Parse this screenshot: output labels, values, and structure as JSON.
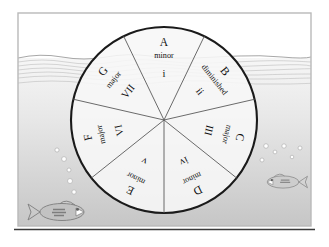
{
  "scene": {
    "title": "Diatonic wheel underwater scene",
    "frame_color": "#b9b9b9",
    "baseline_color": "#3a3a3a",
    "sky_color": "#ffffff",
    "water_top_color": "#f3f3f3",
    "water_bottom_color": "#c9c9c9",
    "wave_color": "#9a9a9a",
    "bubble_color": "#ffffff",
    "bubble_stroke": "#b0b0b0",
    "fish_color": "#9b9b9b"
  },
  "wheel": {
    "center_x": 164,
    "center_y": 120,
    "radius": 93,
    "outline_color": "#1a1a1a",
    "spoke_color": "#555555",
    "fill_color": "#f7f7f7",
    "sector_count": 7,
    "sectors": [
      {
        "id": "a-minor",
        "root": "A",
        "quality": "minor",
        "numeral": "i",
        "start_angle": -25.7,
        "end_angle": 25.7,
        "mid_angle": 0
      },
      {
        "id": "b-diminished",
        "root": "B",
        "quality": "diminished",
        "numeral": "ii",
        "start_angle": 25.7,
        "end_angle": 77.1,
        "mid_angle": 51.4
      },
      {
        "id": "c-major",
        "root": "C",
        "quality": "major",
        "numeral": "III",
        "start_angle": 77.1,
        "end_angle": 128.6,
        "mid_angle": 102.9
      },
      {
        "id": "d-minor",
        "root": "D",
        "quality": "minor",
        "numeral": "iv",
        "start_angle": 128.6,
        "end_angle": 180,
        "mid_angle": 154.3
      },
      {
        "id": "e-minor",
        "root": "E",
        "quality": "minor",
        "numeral": "v",
        "start_angle": 180,
        "end_angle": 231.4,
        "mid_angle": 205.7
      },
      {
        "id": "f-major",
        "root": "F",
        "quality": "major",
        "numeral": "VI",
        "start_angle": 231.4,
        "end_angle": 282.9,
        "mid_angle": 257.1
      },
      {
        "id": "g-major",
        "root": "G",
        "quality": "major",
        "numeral": "VII",
        "start_angle": 282.9,
        "end_angle": 334.3,
        "mid_angle": 308.6
      }
    ]
  },
  "water": {
    "surface_y": 58,
    "ripple_count": 6
  },
  "fish": [
    {
      "id": "fish-left",
      "x": 62,
      "y": 212,
      "scale": 1.0,
      "facing": "right"
    },
    {
      "id": "fish-right",
      "x": 283,
      "y": 182,
      "scale": 0.72,
      "facing": "left"
    }
  ],
  "bubbles": [
    {
      "cx": 57,
      "cy": 150,
      "r": 2.1
    },
    {
      "cx": 64,
      "cy": 159,
      "r": 2.4
    },
    {
      "cx": 69,
      "cy": 170,
      "r": 2.0
    },
    {
      "cx": 70,
      "cy": 181,
      "r": 2.5
    },
    {
      "cx": 74,
      "cy": 192,
      "r": 2.2
    },
    {
      "cx": 266,
      "cy": 146,
      "r": 2.3
    },
    {
      "cx": 275,
      "cy": 152,
      "r": 1.9
    },
    {
      "cx": 284,
      "cy": 146,
      "r": 2.2
    },
    {
      "cx": 262,
      "cy": 160,
      "r": 2.0
    },
    {
      "cx": 292,
      "cy": 157,
      "r": 1.8
    },
    {
      "cx": 300,
      "cy": 148,
      "r": 2.0
    }
  ]
}
